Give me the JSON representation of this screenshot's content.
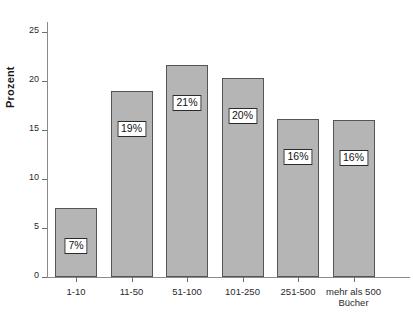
{
  "chart_data": {
    "type": "bar",
    "title": "",
    "subtitle": "",
    "xlabel": "Bücher",
    "ylabel": "Prozent",
    "categories": [
      "1-10",
      "11-50",
      "51-100",
      "101-250",
      "251-500",
      "mehr als 500\nBücher"
    ],
    "values": [
      7,
      19,
      21.6,
      20.3,
      16.1,
      16
    ],
    "data_labels": [
      "7%",
      "19%",
      "21%",
      "20%",
      "16%",
      "16%"
    ],
    "ylim": [
      0,
      26
    ],
    "ytick_labels": [
      "0",
      "5",
      "10",
      "15",
      "20",
      "25"
    ],
    "ytick_values": [
      0,
      5,
      10,
      15,
      20,
      25
    ],
    "grid": false,
    "legend": null,
    "bar_color": "#b5b5b5",
    "bar_edge_color": "#555555",
    "axis_color": "#8a8a8a",
    "label_box_bg": "#ffffff",
    "label_box_border": "#2b2b2b"
  }
}
